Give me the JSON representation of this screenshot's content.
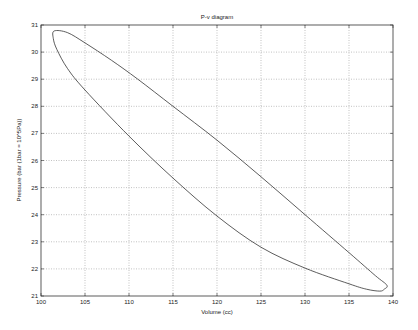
{
  "chart_data": {
    "type": "line",
    "title": "P-v diagram",
    "xlabel": "Volume (cc)",
    "ylabel": "Pressure (bar (1bar = 10^5Pa))",
    "xlim": [
      100,
      140
    ],
    "ylim": [
      21,
      31
    ],
    "xticks": [
      100,
      105,
      110,
      115,
      120,
      125,
      130,
      135,
      140
    ],
    "yticks": [
      21,
      22,
      23,
      24,
      25,
      26,
      27,
      28,
      29,
      30,
      31
    ],
    "grid": true,
    "legend": null,
    "series": [
      {
        "name": "P-v loop",
        "color": "#333333",
        "closed": true,
        "x": [
          101.5,
          103.0,
          105.0,
          108.0,
          111.0,
          115.0,
          120.0,
          125.0,
          130.0,
          135.0,
          138.0,
          139.3,
          139.0,
          138.5,
          137.0,
          135.0,
          130.0,
          125.0,
          120.0,
          115.0,
          110.0,
          105.0,
          103.0,
          101.8,
          101.4,
          101.5
        ],
        "y": [
          30.78,
          30.72,
          30.34,
          29.7,
          29.0,
          28.0,
          26.75,
          25.4,
          24.0,
          22.6,
          21.75,
          21.4,
          21.25,
          21.18,
          21.25,
          21.45,
          22.03,
          22.8,
          23.95,
          25.35,
          26.9,
          28.6,
          29.4,
          30.1,
          30.5,
          30.78
        ]
      }
    ]
  }
}
